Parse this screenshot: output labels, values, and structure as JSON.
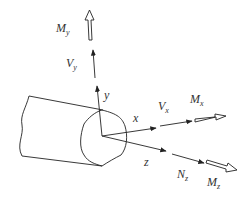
{
  "diagram": {
    "type": "beam-internal-forces",
    "labels": {
      "My": {
        "main": "M",
        "sub": "y"
      },
      "Vy": {
        "main": "V",
        "sub": "y"
      },
      "y": "y",
      "x": "x",
      "z": "z",
      "Vx": {
        "main": "V",
        "sub": "x"
      },
      "Mx": {
        "main": "M",
        "sub": "x"
      },
      "Nz": {
        "main": "N",
        "sub": "z"
      },
      "Mz": {
        "main": "M",
        "sub": "z"
      }
    },
    "colors": {
      "stroke": "#222222",
      "background": "#ffffff"
    }
  }
}
